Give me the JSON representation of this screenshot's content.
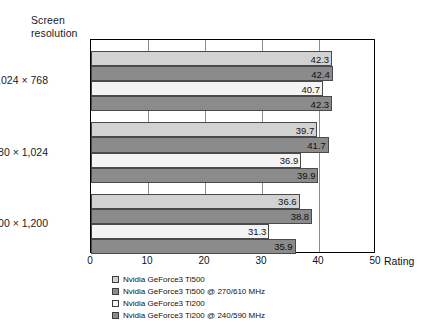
{
  "chart_data": {
    "type": "bar",
    "orientation": "horizontal",
    "title": "",
    "xlabel": "Rating",
    "ylabel": "Screen\nresolution",
    "xlim": [
      0,
      50
    ],
    "xticks": [
      0,
      10,
      20,
      30,
      40,
      50
    ],
    "grid": true,
    "grid_axis": "x",
    "legend_position": "bottom-left",
    "categories": [
      "1,024 × 768",
      "1,280 × 1,024",
      "1,600 × 1,200"
    ],
    "series": [
      {
        "name": "Nvidia GeForce3 Ti500",
        "color": "#d2d2d2",
        "values": [
          42.3,
          39.7,
          36.6
        ]
      },
      {
        "name": "Nvidia GeForce3 Ti500 @ 270/610 MHz",
        "color": "#8b8b8b",
        "values": [
          42.4,
          41.7,
          38.8
        ]
      },
      {
        "name": "Nvidia GeForce3 Ti200",
        "color": "#f4f4f4",
        "values": [
          40.7,
          36.9,
          31.3
        ]
      },
      {
        "name": "Nvidia GeForce3 Ti200 @ 240/590 MHz",
        "color": "#8b8b8b",
        "values": [
          42.3,
          39.9,
          35.9
        ]
      }
    ]
  },
  "axis": {
    "y_title": "Screen\nresolution",
    "x_title": "Rating",
    "x_tick_labels": [
      "0",
      "10",
      "20",
      "30",
      "40",
      "50"
    ]
  },
  "legend": {
    "items": [
      {
        "label": "Nvidia GeForce3 Ti500"
      },
      {
        "label": "Nvidia GeForce3 Ti500 @ 270/610 MHz"
      },
      {
        "label": "Nvidia GeForce3 Ti200"
      },
      {
        "label": "Nvidia GeForce3 Ti200 @ 240/590 MHz"
      }
    ]
  }
}
